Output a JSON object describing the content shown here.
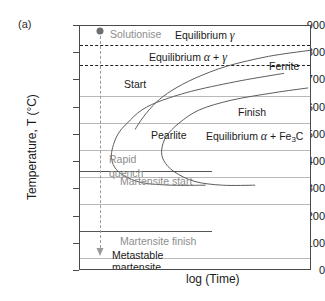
{
  "figure": {
    "panel_label": "(a)",
    "xlabel": "log (Time)",
    "ylabel": "Temperature, T (°C)"
  },
  "axes": {
    "yticks": [
      "900",
      "800",
      "700",
      "600",
      "500",
      "400",
      "300",
      "200",
      "100",
      "0"
    ],
    "ylim": [
      0,
      900
    ],
    "xlim_note": "logarithmic time, unlabelled"
  },
  "labels": {
    "solutionise": "Solutionise",
    "equilibrium_gamma_pre": "Equilibrium",
    "equilibrium_gamma_sym": "γ",
    "equilibrium_alpha_gamma_pre": "Equilibrium",
    "equilibrium_alpha_gamma_a": "α",
    "equilibrium_alpha_gamma_plus": "+",
    "equilibrium_alpha_gamma_g": "γ",
    "ferrite": "Ferrite",
    "start": "Start",
    "finish": "Finish",
    "pearlite": "Pearlite",
    "equilibrium_carbide_pre": "Equilibrium",
    "equilibrium_carbide_a": "α",
    "equilibrium_carbide_plus": "+ Fe",
    "equilibrium_carbide_sub": "3",
    "equilibrium_carbide_c": "C",
    "rapid": "Rapid",
    "quench": "quench",
    "martensite_start": "Martensite start",
    "martensite_finish": "Martensite finish",
    "metastable": "Metastable",
    "martensite": "martensite"
  },
  "colors": {
    "frame": "#4a4a4a",
    "gridline": "#b9b9b9",
    "dashed_equilibrium": "#222222",
    "quench_path": "#9a9a9a",
    "gray_text": "#8d8d8d",
    "curve": "#5a5a5a"
  },
  "chart_data": {
    "type": "line",
    "xlabel": "log (Time)",
    "ylabel": "Temperature, T (°C)",
    "ylim": [
      0,
      900
    ],
    "grid": true,
    "legend": "none (inline annotations)",
    "gridline_temperatures": [
      700,
      600,
      500,
      400,
      300,
      100
    ],
    "equilibrium_lines": [
      {
        "name": "Equilibrium gamma boundary (A3)",
        "temperature": 800,
        "style": "dashed"
      },
      {
        "name": "Eutectoid boundary (A1)",
        "temperature": 725,
        "style": "dashed"
      }
    ],
    "horizontal_solid_lines": [
      {
        "name": "Martensite start",
        "temperature": 350
      },
      {
        "name": "Martensite finish",
        "temperature": 200
      }
    ],
    "series": [
      {
        "name": "Start",
        "nose_temperature": 540,
        "points_frac": [
          [
            0.885,
            0.805
          ],
          [
            0.7,
            0.775
          ],
          [
            0.5,
            0.735
          ],
          [
            0.36,
            0.695
          ],
          [
            0.27,
            0.655
          ],
          [
            0.205,
            0.6
          ],
          [
            0.165,
            0.555
          ],
          [
            0.142,
            0.5
          ],
          [
            0.137,
            0.46
          ],
          [
            0.15,
            0.42
          ],
          [
            0.19,
            0.385
          ],
          [
            0.27,
            0.355
          ],
          [
            0.4,
            0.345
          ],
          [
            0.545,
            0.345
          ]
        ]
      },
      {
        "name": "Finish",
        "nose_temperature": 530,
        "points_frac": [
          [
            0.99,
            0.745
          ],
          [
            0.84,
            0.725
          ],
          [
            0.66,
            0.695
          ],
          [
            0.52,
            0.655
          ],
          [
            0.43,
            0.6
          ],
          [
            0.375,
            0.545
          ],
          [
            0.355,
            0.49
          ],
          [
            0.365,
            0.445
          ],
          [
            0.41,
            0.4
          ],
          [
            0.5,
            0.36
          ],
          [
            0.62,
            0.345
          ],
          [
            0.76,
            0.345
          ]
        ]
      },
      {
        "name": "Ferrite boundary (upper)",
        "points_frac": [
          [
            1.0,
            0.9
          ],
          [
            0.82,
            0.875
          ],
          [
            0.64,
            0.835
          ],
          [
            0.5,
            0.785
          ],
          [
            0.4,
            0.735
          ],
          [
            0.33,
            0.685
          ],
          [
            0.275,
            0.625
          ],
          [
            0.24,
            0.575
          ]
        ]
      }
    ],
    "quench_path": {
      "name": "Rapid quench",
      "from_temperature": 880,
      "to_temperature": 40,
      "style": "dashed with arrowhead",
      "start_marker": "filled circle"
    },
    "regions": [
      "Equilibrium γ",
      "Equilibrium α + γ",
      "Pearlite",
      "Equilibrium α + Fe3C",
      "Metastable martensite"
    ]
  }
}
